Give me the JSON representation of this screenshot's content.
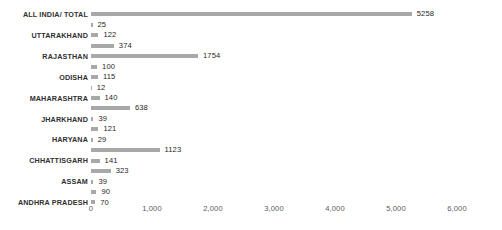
{
  "chart_data": {
    "type": "bar",
    "orientation": "horizontal",
    "title": "",
    "subtitle": "",
    "xlabel": "",
    "ylabel": "",
    "xlim": [
      0,
      6000
    ],
    "xticks": [
      0,
      1000,
      2000,
      3000,
      4000,
      5000,
      6000
    ],
    "xtick_labels": [
      "0",
      "1,000",
      "2,000",
      "3,000",
      "4,000",
      "5,000",
      "6,000"
    ],
    "grid": false,
    "legend": null,
    "bar_color": "#a8a8a8",
    "value_labels_shown": true,
    "note": "Category axis labels are printed on alternating rows only; every row carries a bar with a value label.",
    "categories": [
      "ALL INDIA/ TOTAL",
      "",
      "UTTARAKHAND",
      "",
      "RAJASTHAN",
      "",
      "ODISHA",
      "",
      "MAHARASHTRA",
      "",
      "JHARKHAND",
      "",
      "HARYANA",
      "",
      "CHHATTISGARH",
      "",
      "ASSAM",
      "",
      "ANDHRA PRADESH"
    ],
    "values": [
      5258,
      25,
      122,
      374,
      1754,
      100,
      115,
      12,
      140,
      638,
      39,
      121,
      29,
      1123,
      141,
      323,
      39,
      90,
      70
    ],
    "value_label_texts": [
      "5258",
      "25",
      "122",
      "374",
      "1754",
      "100",
      "115",
      "12",
      "140",
      "638",
      "39",
      "121",
      "29",
      "1123",
      "141",
      "323",
      "39",
      "90",
      "70"
    ]
  }
}
